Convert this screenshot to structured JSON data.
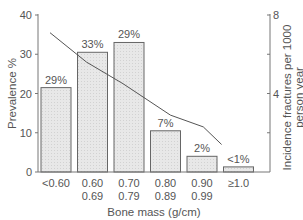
{
  "chart_data": {
    "type": "bar",
    "title": "",
    "xlabel": "Bone mass (g/cm)",
    "ylabel": "Prevalence %",
    "y2label": [
      "Incidence fractures per 1000",
      "person year"
    ],
    "ylim": [
      0,
      40
    ],
    "y2lim": [
      0,
      8
    ],
    "yticks": [
      0,
      10,
      20,
      30,
      40
    ],
    "y2ticks": [
      4,
      8
    ],
    "y2minor_ticks": [
      2,
      6
    ],
    "categories": [
      [
        "<0.60"
      ],
      [
        "0.60",
        "0.69"
      ],
      [
        "0.70",
        "0.79"
      ],
      [
        "0.80",
        "0.89"
      ],
      [
        "0.90",
        "0.99"
      ],
      [
        "≥1.0"
      ]
    ],
    "series": [
      {
        "name": "Prevalence %",
        "type": "bar",
        "axis": "left",
        "values": [
          21.5,
          30.5,
          33,
          10.5,
          4,
          1.3
        ],
        "labels": [
          "29%",
          "33%",
          "29%",
          "7%",
          "2%",
          "<1%"
        ]
      },
      {
        "name": "Incidence fractures per 1000 person year",
        "type": "line",
        "axis": "right",
        "x": [
          0,
          1,
          2,
          3.3,
          4.2,
          4.7
        ],
        "values": [
          7.1,
          5.6,
          4.5,
          2.9,
          2.3,
          1.4
        ]
      }
    ],
    "grid": false,
    "legend": null
  },
  "colors": {
    "bar_fill": "#e6e6e6",
    "bar_stroke": "#666666",
    "line": "#555555",
    "axis": "#777777"
  }
}
